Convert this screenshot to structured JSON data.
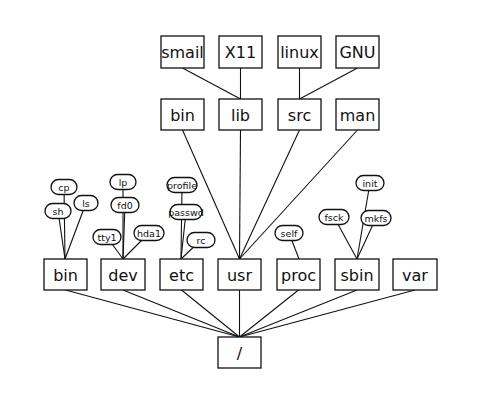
{
  "diagram": {
    "root": {
      "label": "/",
      "x": 218,
      "y": 337,
      "w": 43,
      "h": 31
    },
    "level1": [
      {
        "label": "bin",
        "x": 44,
        "y": 259,
        "w": 43,
        "h": 31
      },
      {
        "label": "dev",
        "x": 101,
        "y": 259,
        "w": 44,
        "h": 31
      },
      {
        "label": "etc",
        "x": 160,
        "y": 259,
        "w": 43,
        "h": 31
      },
      {
        "label": "usr",
        "x": 218,
        "y": 259,
        "w": 43,
        "h": 31
      },
      {
        "label": "proc",
        "x": 277,
        "y": 259,
        "w": 43,
        "h": 31
      },
      {
        "label": "sbin",
        "x": 335,
        "y": 259,
        "w": 44,
        "h": 31
      },
      {
        "label": "var",
        "x": 393,
        "y": 259,
        "w": 44,
        "h": 31
      }
    ],
    "usr_children": [
      {
        "label": "bin",
        "x": 161,
        "y": 99,
        "w": 43,
        "h": 31
      },
      {
        "label": "lib",
        "x": 219,
        "y": 99,
        "w": 43,
        "h": 31
      },
      {
        "label": "src",
        "x": 278,
        "y": 99,
        "w": 43,
        "h": 31
      },
      {
        "label": "man",
        "x": 336,
        "y": 99,
        "w": 43,
        "h": 31
      }
    ],
    "top": [
      {
        "label": "smail",
        "x": 161,
        "y": 36,
        "w": 43,
        "h": 32,
        "parent": "lib"
      },
      {
        "label": "X11",
        "x": 219,
        "y": 36,
        "w": 43,
        "h": 32,
        "parent": "lib"
      },
      {
        "label": "linux",
        "x": 278,
        "y": 36,
        "w": 43,
        "h": 32,
        "parent": "src"
      },
      {
        "label": "GNU",
        "x": 336,
        "y": 36,
        "w": 43,
        "h": 32,
        "parent": "src"
      }
    ],
    "leaves": {
      "bin": {
        "anchor": [
          65,
          259
        ],
        "items": [
          {
            "label": "cp",
            "cx": 64,
            "cy": 187,
            "w": 26
          },
          {
            "label": "sh",
            "cx": 58,
            "cy": 211,
            "w": 26
          },
          {
            "label": "ls",
            "cx": 86,
            "cy": 203,
            "w": 24
          }
        ]
      },
      "dev": {
        "anchor": [
          123,
          259
        ],
        "items": [
          {
            "label": "lp",
            "cx": 123,
            "cy": 182,
            "w": 26
          },
          {
            "label": "fd0",
            "cx": 125,
            "cy": 205,
            "w": 28
          },
          {
            "label": "tty1",
            "cx": 107,
            "cy": 237,
            "w": 28
          },
          {
            "label": "hda1",
            "cx": 149,
            "cy": 233,
            "w": 30
          }
        ]
      },
      "etc": {
        "anchor": [
          181,
          259
        ],
        "items": [
          {
            "label": "profile",
            "cx": 182,
            "cy": 185,
            "w": 30
          },
          {
            "label": "passwd",
            "cx": 186,
            "cy": 212,
            "w": 32
          },
          {
            "label": "rc",
            "cx": 201,
            "cy": 240,
            "w": 28
          }
        ]
      },
      "proc": {
        "anchor": [
          299,
          259
        ],
        "items": [
          {
            "label": "self",
            "cx": 289,
            "cy": 233,
            "w": 28
          }
        ]
      },
      "sbin": {
        "anchor": [
          357,
          259
        ],
        "items": [
          {
            "label": "init",
            "cx": 370,
            "cy": 183,
            "w": 28
          },
          {
            "label": "fsck",
            "cx": 334,
            "cy": 217,
            "w": 30
          },
          {
            "label": "mkfs",
            "cx": 376,
            "cy": 218,
            "w": 30
          }
        ]
      }
    }
  }
}
